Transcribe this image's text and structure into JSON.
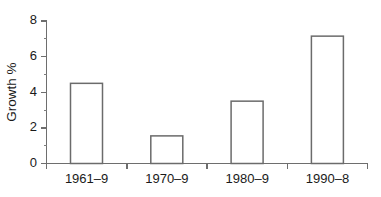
{
  "chart_data": {
    "type": "bar",
    "title": "",
    "subtitle": "",
    "xlabel": "",
    "ylabel": "Growth %",
    "categories": [
      "1961–9",
      "1970–9",
      "1980–9",
      "1990–8"
    ],
    "values": [
      4.5,
      1.55,
      3.5,
      7.15
    ],
    "series": [
      {
        "name": "Growth %",
        "values": [
          4.5,
          1.55,
          3.5,
          7.15
        ]
      }
    ],
    "ylim": [
      0,
      8
    ],
    "y_ticks": [
      0,
      2,
      4,
      6,
      8
    ],
    "y_tick_labels": [
      "0",
      "2",
      "4",
      "6",
      "8"
    ],
    "y_minor_ticks": [
      1,
      3,
      5,
      7
    ],
    "grid": false,
    "legend": false,
    "legend_position": "none",
    "bar_fill_color": "#ffffff",
    "bar_edge_color": "#6b6b6b",
    "axis_color": "#6e6e6e",
    "text_color": "#1a1a1a",
    "background_color": "#ffffff"
  }
}
